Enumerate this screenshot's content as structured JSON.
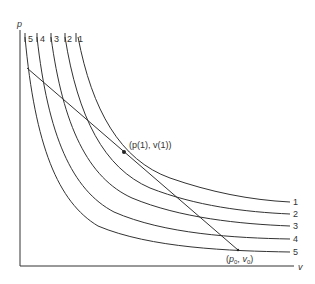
{
  "figure": {
    "y_axis_label": "p",
    "x_axis_label": "v",
    "curve_top_labels": [
      "5",
      "4",
      "3",
      "2",
      "1"
    ],
    "curve_right_labels": [
      "1",
      "2",
      "3",
      "4",
      "5"
    ],
    "point_label": "(p(1), v(1))",
    "origin_point_label": "(p0, v0)",
    "colors": {
      "line": "#333333",
      "background": "#ffffff"
    }
  },
  "curves": [
    {
      "id": "1",
      "top": [
        78,
        37
      ],
      "end": [
        290,
        202
      ]
    },
    {
      "id": "2",
      "top": [
        65,
        37
      ],
      "end": [
        290,
        214
      ]
    },
    {
      "id": "3",
      "top": [
        51,
        37
      ],
      "end": [
        290,
        226
      ]
    },
    {
      "id": "4",
      "top": [
        37,
        37
      ],
      "end": [
        290,
        239
      ]
    },
    {
      "id": "5",
      "top": [
        25,
        37
      ],
      "end": [
        290,
        252
      ]
    }
  ],
  "chord": {
    "start": [
      27,
      68
    ],
    "mid": [
      124,
      152
    ],
    "end": [
      238,
      250
    ]
  }
}
